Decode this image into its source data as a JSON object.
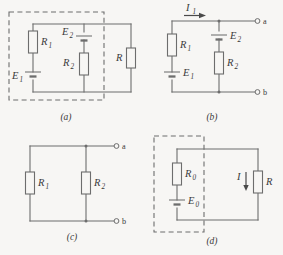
{
  "figure": {
    "background_color": "#f7f6f4",
    "line_color": "#6d6d6d",
    "text_color": "#3a3a3a",
    "panels": [
      {
        "id": "a",
        "label": "(a)"
      },
      {
        "id": "b",
        "label": "(b)"
      },
      {
        "id": "c",
        "label": "(c)"
      },
      {
        "id": "d",
        "label": "(d)"
      }
    ]
  },
  "panel_a": {
    "caption": "(a)",
    "components": {
      "r1": {
        "symbol": "R",
        "subscript": "1"
      },
      "r2": {
        "symbol": "R",
        "subscript": "2"
      },
      "r": {
        "symbol": "R",
        "subscript": ""
      },
      "e1": {
        "symbol": "E",
        "subscript": "1"
      },
      "e2": {
        "symbol": "E",
        "subscript": "2"
      }
    },
    "dashed_enclosure": true
  },
  "panel_b": {
    "caption": "(b)",
    "components": {
      "r1": {
        "symbol": "R",
        "subscript": "1"
      },
      "r2": {
        "symbol": "R",
        "subscript": "2"
      },
      "e1": {
        "symbol": "E",
        "subscript": "1"
      },
      "e2": {
        "symbol": "E",
        "subscript": "2"
      },
      "current": {
        "symbol": "I",
        "subscript": "1"
      }
    },
    "terminals": {
      "top": "a",
      "bottom": "b"
    },
    "dashed_enclosure": false
  },
  "panel_c": {
    "caption": "(c)",
    "components": {
      "r1": {
        "symbol": "R",
        "subscript": "1"
      },
      "r2": {
        "symbol": "R",
        "subscript": "2"
      }
    },
    "terminals": {
      "top": "a",
      "bottom": "b"
    },
    "dashed_enclosure": false
  },
  "panel_d": {
    "caption": "(d)",
    "components": {
      "r0": {
        "symbol": "R",
        "subscript": "0"
      },
      "e0": {
        "symbol": "E",
        "subscript": "0"
      },
      "r": {
        "symbol": "R",
        "subscript": ""
      },
      "current": {
        "symbol": "I",
        "subscript": ""
      }
    },
    "dashed_enclosure": true
  }
}
